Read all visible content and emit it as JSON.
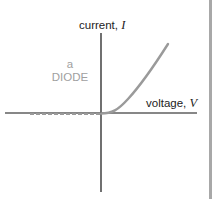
{
  "diagram": {
    "y_axis": {
      "label": "current,",
      "symbol": "I"
    },
    "x_axis": {
      "label": "voltage,",
      "symbol": "V"
    },
    "device": {
      "article": "a",
      "name": "DIODE"
    },
    "colors": {
      "axis": "#111111",
      "curve": "#9a9a9a",
      "reverse_dashed": "#9a9a9a",
      "device_label": "#a0a0a0",
      "border": "#a8a8a8"
    },
    "curve_description": "I-V characteristic: zero current for negative voltage (dashed), exponential rise for positive voltage"
  }
}
